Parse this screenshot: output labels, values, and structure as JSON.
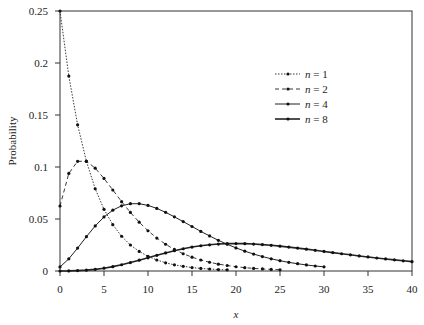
{
  "chart_data": {
    "type": "line",
    "title": "",
    "xlabel": "x",
    "ylabel": "Probability",
    "xlim": [
      0,
      40
    ],
    "ylim": [
      0,
      0.25
    ],
    "xticks": [
      "0",
      "5",
      "10",
      "15",
      "20",
      "25",
      "30",
      "35",
      "40"
    ],
    "yticks": [
      "0",
      "0.05",
      "0.1",
      "0.15",
      "0.2",
      "0.25"
    ],
    "legend_position": "upper right",
    "grid": false,
    "series": [
      {
        "name": "n = 1",
        "style": "dotted",
        "values": [
          0.25,
          0.1875,
          0.1406,
          0.1055,
          0.0791,
          0.0593,
          0.0445,
          0.0334,
          0.025,
          0.0188,
          0.0141,
          0.0106,
          0.0079,
          0.0059,
          0.0045,
          0.0033,
          0.0025,
          0.0019,
          0.0014,
          0.0011
        ]
      },
      {
        "name": "n = 2",
        "style": "dashed",
        "values": [
          0.0625,
          0.0938,
          0.1055,
          0.1055,
          0.0989,
          0.089,
          0.0779,
          0.0667,
          0.0563,
          0.0469,
          0.0387,
          0.0317,
          0.0257,
          0.0207,
          0.0166,
          0.0133,
          0.0106,
          0.0084,
          0.0066,
          0.0053,
          0.0041,
          0.0032,
          0.0025,
          0.002,
          0.0015,
          0.0012
        ]
      },
      {
        "name": "n = 4",
        "style": "solid",
        "values": [
          0.0039,
          0.0117,
          0.022,
          0.033,
          0.0433,
          0.052,
          0.0585,
          0.0627,
          0.0647,
          0.0647,
          0.0631,
          0.0602,
          0.0564,
          0.0521,
          0.0475,
          0.0428,
          0.0381,
          0.0337,
          0.0295,
          0.0257,
          0.0222,
          0.0191,
          0.0163,
          0.0139,
          0.0117,
          0.0099,
          0.0083,
          0.007,
          0.0058,
          0.0048,
          0.004
        ]
      },
      {
        "name": "n = 8",
        "style": "thick",
        "values": [
          0.0,
          0.0001,
          0.0004,
          0.0008,
          0.0016,
          0.0027,
          0.0042,
          0.006,
          0.0081,
          0.0104,
          0.0127,
          0.0151,
          0.0174,
          0.0195,
          0.0214,
          0.023,
          0.0243,
          0.0252,
          0.0259,
          0.0263,
          0.0264,
          0.0263,
          0.0259,
          0.0254,
          0.0247,
          0.0239,
          0.023,
          0.022,
          0.021,
          0.0199,
          0.0188,
          0.0177,
          0.0166,
          0.0156,
          0.0145,
          0.0135,
          0.0125,
          0.0116,
          0.0107,
          0.0098,
          0.009
        ]
      }
    ]
  }
}
